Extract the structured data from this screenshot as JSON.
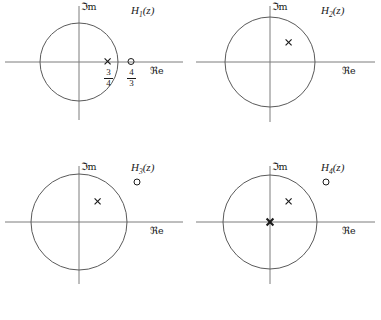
{
  "figure": {
    "axis_color": "#7d7d7d",
    "circle_color": "#5a5a5a",
    "marker_color": "#1a1a1a",
    "background": "#ffffff"
  },
  "axis_labels": {
    "imaginary": "ℑm",
    "real": "ℜe"
  },
  "panels": [
    {
      "id": "panel-1",
      "title": "H",
      "subscript": "1",
      "title_suffix": "(z)",
      "unit_circle": {
        "cx": 79,
        "cy": 62,
        "r": 39
      },
      "axes": {
        "x_start": 5,
        "x_end": 183,
        "y_start": 6,
        "y_end": 120,
        "origin_x": 79,
        "origin_y": 62
      },
      "poles": [
        {
          "x": 0.75,
          "y": 0,
          "px": 108,
          "py": 62,
          "label": "3/4",
          "numerator": "3",
          "denominator": "4"
        }
      ],
      "zeros": [
        {
          "x": 1.3333,
          "y": 0,
          "px": 131,
          "py": 62,
          "label": "4/3",
          "numerator": "4",
          "denominator": "3"
        }
      ]
    },
    {
      "id": "panel-2",
      "title": "H",
      "subscript": "2",
      "title_suffix": "(z)",
      "unit_circle": {
        "cx": 80,
        "cy": 62,
        "r": 45
      },
      "axes": {
        "x_start": 6,
        "x_end": 185,
        "y_start": 6,
        "y_end": 122,
        "origin_x": 80,
        "origin_y": 62
      },
      "poles": [
        {
          "x": 0.42,
          "y": 0.42,
          "px": 99,
          "py": 43
        }
      ],
      "zeros": []
    },
    {
      "id": "panel-3",
      "title": "H",
      "subscript": "3",
      "title_suffix": "(z)",
      "unit_circle": {
        "cx": 79,
        "cy": 62,
        "r": 48
      },
      "axes": {
        "x_start": 5,
        "x_end": 183,
        "y_start": 6,
        "y_end": 124,
        "origin_x": 79,
        "origin_y": 62
      },
      "poles": [
        {
          "x": 0.4,
          "y": 0.41,
          "px": 98,
          "py": 42
        }
      ],
      "zeros": [
        {
          "x": 1.22,
          "y": 0.83,
          "px": 137,
          "py": 22
        }
      ]
    },
    {
      "id": "panel-4",
      "title": "H",
      "subscript": "4",
      "title_suffix": "(z)",
      "unit_circle": {
        "cx": 80,
        "cy": 62,
        "r": 47
      },
      "axes": {
        "x_start": 6,
        "x_end": 185,
        "y_start": 6,
        "y_end": 124,
        "origin_x": 80,
        "origin_y": 62
      },
      "poles": [
        {
          "x": 0.4,
          "y": 0.41,
          "px": 99,
          "py": 42
        },
        {
          "x": 0,
          "y": 0,
          "px": 80,
          "py": 62,
          "emphasis": "double"
        }
      ],
      "zeros": [
        {
          "x": 1.2,
          "y": 0.85,
          "px": 136,
          "py": 22
        }
      ]
    }
  ]
}
